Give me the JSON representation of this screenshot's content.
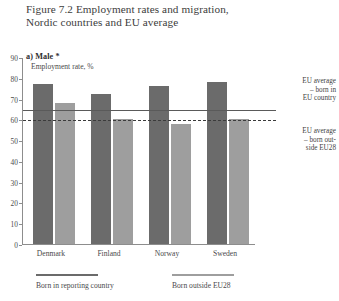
{
  "figure": {
    "title_line1": "Figure 7.2  Employment rates and migration,",
    "title_line2": "Nordic countries and EU average",
    "panel_label": "a) Male *"
  },
  "chart_data": {
    "type": "bar",
    "title": "Figure 7.2  Employment rates and migration, Nordic countries and EU average",
    "subtitle": "a) Male *",
    "xlabel": "",
    "ylabel": "Employment rate, %",
    "ylim": [
      0,
      90
    ],
    "yticks": [
      0,
      10,
      20,
      30,
      40,
      50,
      60,
      70,
      80,
      90
    ],
    "ytick_labels": [
      "0",
      "10",
      "20",
      "30",
      "40",
      "50",
      "60",
      "70",
      "80",
      "90"
    ],
    "grid": false,
    "legend_position": "bottom",
    "categories": [
      "Denmark",
      "Finland",
      "Norway",
      "Sweden"
    ],
    "series": [
      {
        "name": "Born in reporting country",
        "color": "#6b6b6b",
        "values": [
          77,
          72,
          76,
          78
        ]
      },
      {
        "name": "Born outside EU28",
        "color": "#9e9e9e",
        "values": [
          68,
          60,
          58,
          60
        ]
      }
    ],
    "reference_lines": [
      {
        "name": "EU average - born in EU country",
        "value": 65,
        "style": "solid",
        "color": "#5a5a5a",
        "label_line1": "EU average",
        "label_line2": "– born in",
        "label_line3": "EU country"
      },
      {
        "name": "EU average - born outside EU28",
        "value": 60,
        "style": "dashed",
        "color": "#3b3b3b",
        "label_line1": "EU average",
        "label_line2": "– born out-",
        "label_line3": "side EU28"
      }
    ]
  }
}
